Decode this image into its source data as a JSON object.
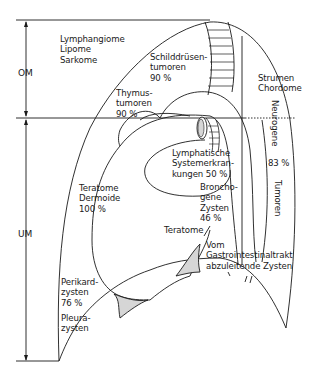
{
  "diagram": {
    "title": "",
    "colors": {
      "line": "#1a1a1a",
      "shade": "#d6d6d6",
      "background": "#ffffff"
    },
    "regions": {
      "upper": {
        "label": "OM"
      },
      "lower": {
        "label": "UM"
      }
    },
    "labels": {
      "lymphangiome": "Lymphangiome\nLipome\nSarkome",
      "schilddruesen": "Schilddrüsen-\ntumoren\n90 %",
      "thymus": "Thymus-\ntumoren\n90 %",
      "strumen": "Strumen\nChordome",
      "neurogene": "Neurogene",
      "neurogene_pct": "83 %",
      "tumoren": "Tumoren",
      "lymphatische": "Lymphatische\nSystemerkran-\nkungen 50 %",
      "bronchogene": "Broncho-\ngene\nZysten\n46 %",
      "teratome_dermoide": "Teratome\nDermoide\n100 %",
      "teratome": "Teratome",
      "gastro": "Vom\nGastrointestinaltrakt\nabzuleitende Zysten",
      "perikard": "Perikard-\nzysten\n76 %",
      "pleura": "Pleura-\nzysten"
    }
  }
}
